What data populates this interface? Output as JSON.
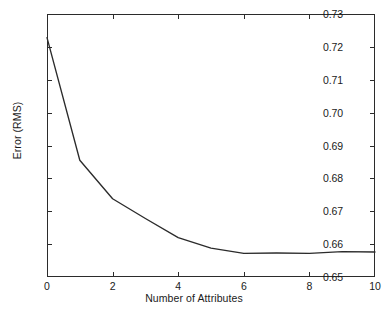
{
  "chart_data": {
    "type": "line",
    "title": "",
    "xlabel": "Number of Attributes",
    "ylabel": "Error (RMS)",
    "xlim": [
      0,
      10
    ],
    "ylim": [
      0.65,
      0.73
    ],
    "grid": false,
    "legend": null,
    "xticks": [
      "0",
      "2",
      "4",
      "6",
      "8",
      "10"
    ],
    "xtick_values": [
      0,
      2,
      4,
      6,
      8,
      10
    ],
    "yticks": [
      "0.65",
      "0.66",
      "0.67",
      "0.68",
      "0.69",
      "0.70",
      "0.71",
      "0.72",
      "0.73"
    ],
    "ytick_values": [
      0.65,
      0.66,
      0.67,
      0.68,
      0.69,
      0.7,
      0.71,
      0.72,
      0.73
    ],
    "series": [
      {
        "name": "Error (RMS)",
        "color": "#2b2b2b",
        "x": [
          0,
          1,
          2,
          3,
          4,
          5,
          6,
          7,
          8,
          9,
          10
        ],
        "values": [
          0.7228,
          0.6855,
          0.6738,
          0.6678,
          0.662,
          0.6588,
          0.6572,
          0.6573,
          0.6572,
          0.6577,
          0.6576
        ]
      }
    ]
  }
}
